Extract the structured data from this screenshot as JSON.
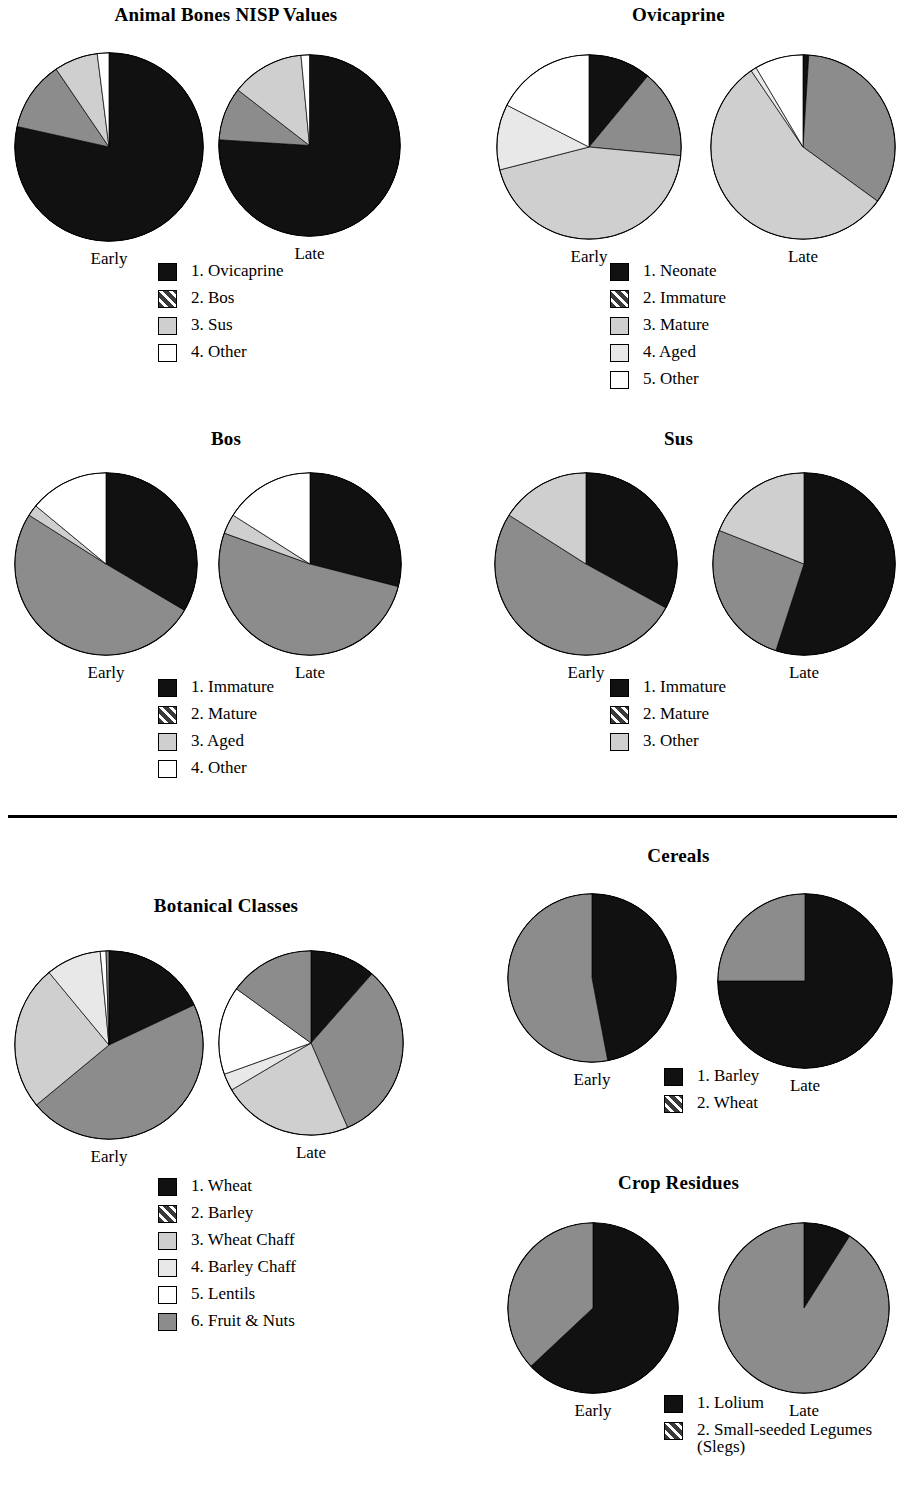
{
  "colors": {
    "black": "#111111",
    "dark_gray_hatch": "#3a3a3a",
    "medium_gray": "#8c8c8c",
    "light_gray": "#cfcfcf",
    "pale_gray": "#e8e8e8",
    "white": "#ffffff",
    "outline": "#000000"
  },
  "period_labels": {
    "early": "Early",
    "late": "Late"
  },
  "panels": [
    {
      "id": "animal-bones-nisp",
      "title": "Animal Bones NISP Values",
      "legend": [
        {
          "n": "1.",
          "label": "Ovicaprine",
          "fill": "black"
        },
        {
          "n": "2.",
          "label": "Bos",
          "fill": "medium_gray"
        },
        {
          "n": "3.",
          "label": "Sus",
          "fill": "light_gray"
        },
        {
          "n": "4.",
          "label": "Other",
          "fill": "white"
        }
      ]
    },
    {
      "id": "ovicaprine",
      "title": "Ovicaprine",
      "legend": [
        {
          "n": "1.",
          "label": "Neonate",
          "fill": "black"
        },
        {
          "n": "2.",
          "label": "Immature",
          "fill": "medium_gray"
        },
        {
          "n": "3.",
          "label": "Mature",
          "fill": "light_gray"
        },
        {
          "n": "4.",
          "label": "Aged",
          "fill": "pale_gray"
        },
        {
          "n": "5.",
          "label": "Other",
          "fill": "white"
        }
      ]
    },
    {
      "id": "bos",
      "title": "Bos",
      "legend": [
        {
          "n": "1.",
          "label": "Immature",
          "fill": "black"
        },
        {
          "n": "2.",
          "label": "Mature",
          "fill": "medium_gray"
        },
        {
          "n": "3.",
          "label": "Aged",
          "fill": "light_gray"
        },
        {
          "n": "4.",
          "label": "Other",
          "fill": "white"
        }
      ]
    },
    {
      "id": "sus",
      "title": "Sus",
      "legend": [
        {
          "n": "1.",
          "label": "Immature",
          "fill": "black"
        },
        {
          "n": "2.",
          "label": "Mature",
          "fill": "medium_gray"
        },
        {
          "n": "3.",
          "label": "Other",
          "fill": "light_gray"
        }
      ]
    },
    {
      "id": "botanical-classes",
      "title": "Botanical Classes",
      "legend": [
        {
          "n": "1.",
          "label": "Wheat",
          "fill": "black"
        },
        {
          "n": "2.",
          "label": "Barley",
          "fill": "medium_gray"
        },
        {
          "n": "3.",
          "label": "Wheat Chaff",
          "fill": "light_gray"
        },
        {
          "n": "4.",
          "label": "Barley Chaff",
          "fill": "pale_gray"
        },
        {
          "n": "5.",
          "label": "Lentils",
          "fill": "white"
        },
        {
          "n": "6.",
          "label": "Fruit & Nuts",
          "fill": "medium_gray"
        }
      ]
    },
    {
      "id": "cereals",
      "title": "Cereals",
      "legend": [
        {
          "n": "1.",
          "label": "Barley",
          "fill": "black"
        },
        {
          "n": "2.",
          "label": "Wheat",
          "fill": "medium_gray"
        }
      ]
    },
    {
      "id": "crop-residues",
      "title": "Crop Residues",
      "legend": [
        {
          "n": "1.",
          "label": "Lolium",
          "fill": "black"
        },
        {
          "n": "2.",
          "label": "Small-seeded Legumes",
          "label2": "(Slegs)",
          "fill": "medium_gray"
        }
      ]
    }
  ],
  "chart_data": [
    {
      "type": "pie",
      "title": "Animal Bones NISP Values",
      "period": "Early",
      "categories": [
        "1. Ovicaprine",
        "2. Bos",
        "3. Sus",
        "4. Other"
      ],
      "values": [
        78.5,
        12.0,
        7.5,
        2.0
      ],
      "unit": "percent",
      "fills": [
        "black",
        "medium_gray",
        "light_gray",
        "white"
      ]
    },
    {
      "type": "pie",
      "title": "Animal Bones NISP Values",
      "period": "Late",
      "categories": [
        "1. Ovicaprine",
        "2. Bos",
        "3. Sus",
        "4. Other"
      ],
      "values": [
        76.0,
        9.5,
        13.0,
        1.5
      ],
      "unit": "percent",
      "fills": [
        "black",
        "medium_gray",
        "light_gray",
        "white"
      ]
    },
    {
      "type": "pie",
      "title": "Ovicaprine",
      "period": "Early",
      "categories": [
        "1. Neonate",
        "2. Immature",
        "3. Mature",
        "4. Aged",
        "5. Other"
      ],
      "values": [
        11.0,
        15.5,
        44.5,
        11.5,
        17.5
      ],
      "unit": "percent",
      "fills": [
        "black",
        "medium_gray",
        "light_gray",
        "pale_gray",
        "white"
      ]
    },
    {
      "type": "pie",
      "title": "Ovicaprine",
      "period": "Late",
      "categories": [
        "1. Neonate",
        "2. Immature",
        "3. Mature",
        "4. Aged",
        "5. Other"
      ],
      "values": [
        1.0,
        34.0,
        55.5,
        1.0,
        8.5
      ],
      "unit": "percent",
      "fills": [
        "black",
        "medium_gray",
        "light_gray",
        "pale_gray",
        "white"
      ]
    },
    {
      "type": "pie",
      "title": "Bos",
      "period": "Early",
      "categories": [
        "1. Immature",
        "2. Mature",
        "3. Aged",
        "4. Other"
      ],
      "values": [
        33.5,
        50.5,
        2.0,
        14.0
      ],
      "unit": "percent",
      "fills": [
        "black",
        "medium_gray",
        "light_gray",
        "white"
      ]
    },
    {
      "type": "pie",
      "title": "Bos",
      "period": "Late",
      "categories": [
        "1. Immature",
        "2. Mature",
        "3. Aged",
        "4. Other"
      ],
      "values": [
        29.0,
        51.5,
        3.5,
        16.0
      ],
      "unit": "percent",
      "fills": [
        "black",
        "medium_gray",
        "light_gray",
        "white"
      ]
    },
    {
      "type": "pie",
      "title": "Sus",
      "period": "Early",
      "categories": [
        "1. Immature",
        "2. Mature",
        "3. Other"
      ],
      "values": [
        33.0,
        51.0,
        16.0
      ],
      "unit": "percent",
      "fills": [
        "black",
        "medium_gray",
        "light_gray"
      ]
    },
    {
      "type": "pie",
      "title": "Sus",
      "period": "Late",
      "categories": [
        "1. Immature",
        "2. Mature",
        "3. Other"
      ],
      "values": [
        55.0,
        26.0,
        19.0
      ],
      "unit": "percent",
      "fills": [
        "black",
        "medium_gray",
        "light_gray"
      ]
    },
    {
      "type": "pie",
      "title": "Botanical Classes",
      "period": "Early",
      "categories": [
        "1. Wheat",
        "2. Barley",
        "3. Wheat Chaff",
        "4. Barley Chaff",
        "5. Lentils",
        "6. Fruit & Nuts"
      ],
      "values": [
        18.0,
        46.0,
        25.0,
        9.5,
        1.0,
        0.5
      ],
      "unit": "percent",
      "fills": [
        "black",
        "medium_gray",
        "light_gray",
        "pale_gray",
        "white",
        "medium_gray"
      ]
    },
    {
      "type": "pie",
      "title": "Botanical Classes",
      "period": "Late",
      "categories": [
        "1. Wheat",
        "2. Barley",
        "3. Wheat Chaff",
        "4. Barley Chaff",
        "5. Lentils",
        "6. Fruit & Nuts"
      ],
      "values": [
        11.5,
        32.0,
        23.0,
        3.0,
        15.5,
        15.0
      ],
      "unit": "percent",
      "fills": [
        "black",
        "medium_gray",
        "light_gray",
        "pale_gray",
        "white",
        "medium_gray"
      ]
    },
    {
      "type": "pie",
      "title": "Cereals",
      "period": "Early",
      "categories": [
        "1. Barley",
        "2. Wheat"
      ],
      "values": [
        47.0,
        53.0
      ],
      "unit": "percent",
      "fills": [
        "black",
        "medium_gray"
      ]
    },
    {
      "type": "pie",
      "title": "Cereals",
      "period": "Late",
      "categories": [
        "1. Barley",
        "2. Wheat"
      ],
      "values": [
        75.0,
        25.0
      ],
      "unit": "percent",
      "fills": [
        "black",
        "medium_gray"
      ]
    },
    {
      "type": "pie",
      "title": "Crop Residues",
      "period": "Early",
      "categories": [
        "1. Lolium",
        "2. Small-seeded Legumes (Slegs)"
      ],
      "values": [
        63.0,
        37.0
      ],
      "unit": "percent",
      "fills": [
        "black",
        "medium_gray"
      ]
    },
    {
      "type": "pie",
      "title": "Crop Residues",
      "period": "Late",
      "categories": [
        "1. Lolium",
        "2. Small-seeded Legumes (Slegs)"
      ],
      "values": [
        9.0,
        91.0
      ],
      "unit": "percent",
      "fills": [
        "black",
        "medium_gray"
      ]
    }
  ]
}
